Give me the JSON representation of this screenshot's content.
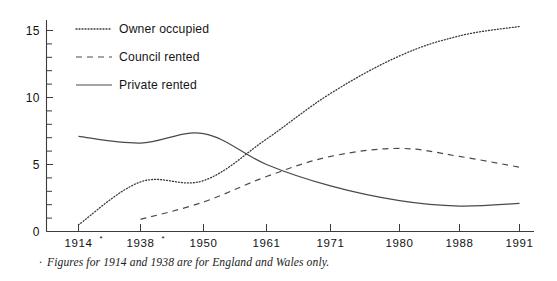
{
  "chart_data": {
    "type": "line",
    "title": "",
    "subtitle": "",
    "xlabel": "",
    "ylabel": "",
    "x": [
      "1914*",
      "1938*",
      "1950",
      "1961",
      "1971",
      "1980",
      "1988",
      "1991"
    ],
    "x_tick_labels": [
      "1914",
      "1938",
      "1950",
      "1961",
      "1971",
      "1980",
      "1988",
      "1991"
    ],
    "x_tick_markers": [
      "*",
      "*",
      "",
      "",
      "",
      "",
      "",
      ""
    ],
    "ylim": [
      0,
      15.8
    ],
    "y_tick_labels": [
      "0",
      "5",
      "10",
      "15"
    ],
    "y_ticks": [
      0,
      5,
      10,
      15
    ],
    "y_minor_tick_step": 1,
    "grid": false,
    "legend_position": "top-left",
    "series": [
      {
        "name": "Owner occupied",
        "style": "dotted",
        "color": "#3a3a3a",
        "values": [
          0.5,
          3.7,
          3.8,
          6.9,
          10.3,
          13.1,
          14.6,
          15.3
        ]
      },
      {
        "name": "Council rented",
        "style": "dashed",
        "color": "#4a4a4a",
        "values": [
          null,
          0.9,
          2.2,
          4.1,
          5.6,
          6.2,
          5.6,
          4.8
        ]
      },
      {
        "name": "Private rented",
        "style": "solid",
        "color": "#4a4a4a",
        "values": [
          7.1,
          6.6,
          7.3,
          5.0,
          3.4,
          2.3,
          1.9,
          2.1
        ]
      }
    ],
    "annotations": [
      "Figures for 1914 and 1938 are for England and Wales only."
    ]
  },
  "legend": {
    "items": [
      {
        "label": "Owner occupied",
        "style": "dotted"
      },
      {
        "label": "Council rented",
        "style": "dashed"
      },
      {
        "label": "Private rented",
        "style": "solid"
      }
    ]
  },
  "footnote": {
    "marker": "·",
    "text": "Figures for 1914 and 1938 are for England and Wales only."
  },
  "colors": {
    "axis": "#3c3c3c",
    "text": "#121212",
    "owner_occupied": "#3a3a3a",
    "council_rented": "#4a4a4a",
    "private_rented": "#4a4a4a"
  }
}
